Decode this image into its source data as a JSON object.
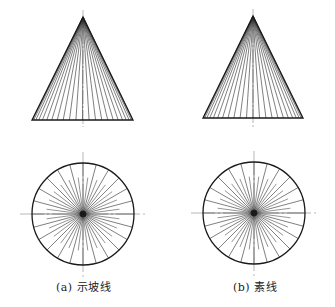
{
  "figure": {
    "width": 335,
    "height": 307,
    "colors": {
      "outline": "#1a1a1a",
      "generator": "#2a2a2a",
      "centerline": "#9a9a9a",
      "background": "#ffffff"
    },
    "panels": [
      {
        "id": "a",
        "caption": "(a) 示坡线",
        "cone": {
          "apex": [
            83,
            17
          ],
          "base_y": 120,
          "base_left": 32,
          "base_right": 133,
          "axis_top": 10,
          "axis_bottom": 127
        },
        "circle": {
          "cx": 83,
          "cy": 214,
          "r": 51,
          "divisions": 48,
          "short_ratio": 0.72,
          "center_h": [
            20,
            147
          ],
          "center_v": [
            152,
            278
          ]
        },
        "generator_divisions": 48
      },
      {
        "id": "b",
        "caption": "(b) 素线",
        "cone": {
          "apex": [
            253,
            16
          ],
          "base_y": 118,
          "base_left": 203,
          "base_right": 303,
          "axis_top": 9,
          "axis_bottom": 127
        },
        "circle": {
          "cx": 254,
          "cy": 213,
          "r": 51,
          "divisions": 48,
          "short_ratio": 0.72,
          "center_h": [
            191,
            318
          ],
          "center_v": [
            151,
            277
          ]
        },
        "generator_divisions": 48
      }
    ]
  },
  "captions": {
    "a": "(a) 示坡线",
    "b": "(b) 素线"
  }
}
